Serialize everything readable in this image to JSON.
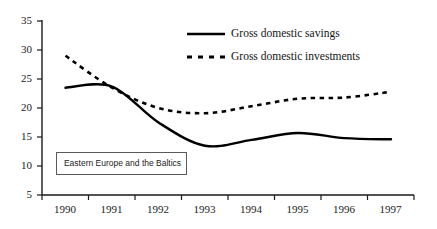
{
  "chart_data": {
    "type": "line",
    "title": "",
    "xlabel": "",
    "ylabel": "",
    "annotation": "Eastern Europe and the Baltics",
    "grid": false,
    "legend_position": "top-center",
    "categories": [
      "1990",
      "1991",
      "1992",
      "1993",
      "1994",
      "1995",
      "1996",
      "1997"
    ],
    "x_ticks": [
      "1990",
      "1991",
      "1992",
      "1993",
      "1994",
      "1995",
      "1996",
      "1997"
    ],
    "y_ticks": [
      "5",
      "10",
      "15",
      "20",
      "25",
      "30",
      "35"
    ],
    "ylim": [
      5,
      35
    ],
    "series": [
      {
        "name": "Gross domestic savings",
        "style": "solid",
        "color": "#000000",
        "values": [
          23.5,
          23.7,
          17.5,
          13.5,
          14.5,
          15.7,
          14.8,
          14.6
        ]
      },
      {
        "name": "Gross domestic investments",
        "style": "dashed",
        "color": "#000000",
        "values": [
          29.0,
          23.5,
          20.0,
          19.1,
          20.3,
          21.6,
          21.8,
          22.8
        ]
      }
    ]
  },
  "legend": {
    "items": [
      {
        "label": "Gross domestic savings",
        "style": "solid"
      },
      {
        "label": "Gross domestic investments",
        "style": "dashed"
      }
    ]
  },
  "axis": {
    "y_labels": [
      "35",
      "30",
      "25",
      "20",
      "15",
      "10",
      "5"
    ],
    "x_labels": [
      "1990",
      "1991",
      "1992",
      "1993",
      "1994",
      "1995",
      "1996",
      "1997"
    ]
  }
}
